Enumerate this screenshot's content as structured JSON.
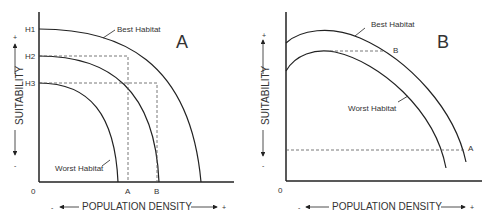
{
  "panel_a": {
    "label": "A",
    "y_ticks": [
      "H1",
      "H2",
      "H3"
    ],
    "x_ticks": [
      "A",
      "B"
    ],
    "origin": "0",
    "curve_labels": {
      "best": "Best Habitat",
      "worst": "Worst Habitat"
    },
    "y_axis": {
      "label": "SUITABILITY",
      "plus": "+",
      "minus": "-"
    },
    "x_axis": {
      "label": "POPULATION DENSITY",
      "plus": "+",
      "minus": "-"
    }
  },
  "panel_b": {
    "label": "B",
    "origin": "0",
    "curve_labels": {
      "best": "Best Habitat",
      "worst": "Worst Habitat"
    },
    "point_labels": {
      "a": "A",
      "b": "B"
    },
    "y_axis": {
      "label": "SUITABILITY",
      "plus": "+",
      "minus": "-"
    },
    "x_axis": {
      "label": "POPULATION DENSITY",
      "plus": "+",
      "minus": "-"
    }
  },
  "colors": {
    "line": "#222222",
    "dash": "#555555",
    "text": "#333333"
  }
}
